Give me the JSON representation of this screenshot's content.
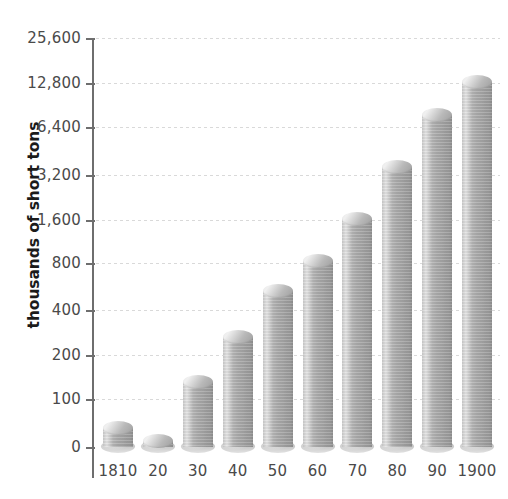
{
  "chart_data": {
    "type": "bar",
    "title": "",
    "subtitle": "",
    "xlabel": "",
    "ylabel": "thousands of short tons",
    "categories": [
      "1810",
      "20",
      "30",
      "40",
      "50",
      "60",
      "70",
      "80",
      "90",
      "1900"
    ],
    "values": [
      55,
      28,
      155,
      310,
      620,
      970,
      1900,
      4200,
      9200,
      15000
    ],
    "yticks": [
      0,
      100,
      200,
      400,
      800,
      1600,
      3200,
      6400,
      12800,
      25600
    ],
    "ytick_labels": [
      "0",
      "100",
      "200",
      "400",
      "800",
      "1,600",
      "3,200",
      "6,400",
      "12,800",
      "25,600"
    ],
    "ytick_pixel_y": [
      447,
      399,
      355,
      310,
      263,
      220,
      175,
      127,
      83,
      38
    ],
    "ylim": [
      0,
      25600
    ],
    "scale": "log2-like (doubling ticks above 100)",
    "grid": true,
    "legend": false,
    "legend_position": "none",
    "bar_style": "3d-cylinder",
    "colors": {
      "bar_light": "#e4e4e4",
      "bar_mid": "#a9a9a9",
      "bar_dark": "#8f8f8f",
      "axis": "#6e6e6e",
      "gridline": "#d9d9d9",
      "tick_text": "#4a4a4a",
      "axis_title_text": "#1b1b1b",
      "background": "#ffffff"
    }
  }
}
